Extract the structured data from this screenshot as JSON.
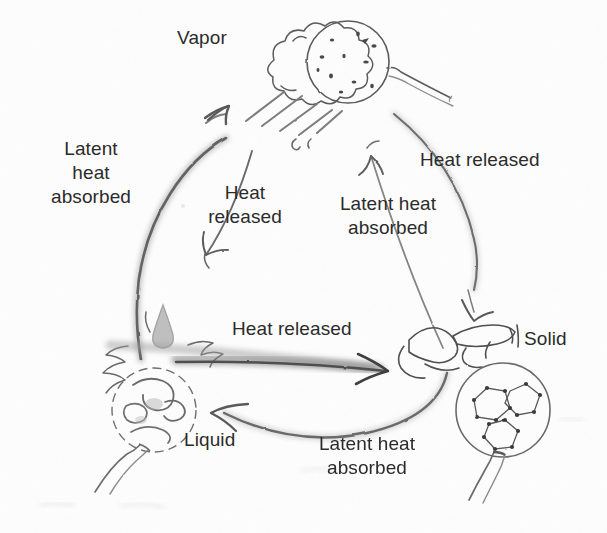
{
  "diagram": {
    "background_color": "#fefefe",
    "ink_color": "#5a5a5a",
    "text_color": "#2b2b2b",
    "states": {
      "vapor": "Vapor",
      "liquid": "Liquid",
      "solid": "Solid"
    },
    "labels": {
      "latent_heat_absorbed_left": "Latent\nheat\nabsorbed",
      "heat_released_top_left": "Heat\nreleased",
      "latent_heat_absorbed_middle": "Latent heat\nabsorbed",
      "heat_released_right": "Heat released",
      "heat_released_center": "Heat released",
      "latent_heat_absorbed_bottom": "Latent heat\nabsorbed"
    },
    "transitions": [
      {
        "from": "Liquid",
        "to": "Vapor",
        "label": "Latent heat absorbed",
        "arrow": "left-arc-up"
      },
      {
        "from": "Vapor",
        "to": "Liquid",
        "label": "Heat released",
        "arrow": "inner-left-down"
      },
      {
        "from": "Solid",
        "to": "Vapor",
        "label": "Latent heat absorbed",
        "arrow": "inner-right-up"
      },
      {
        "from": "Vapor",
        "to": "Solid",
        "label": "Heat released",
        "arrow": "right-arc-down"
      },
      {
        "from": "Liquid",
        "to": "Solid",
        "label": "Heat released",
        "arrow": "bottom-straight-right"
      },
      {
        "from": "Solid",
        "to": "Liquid",
        "label": "Latent heat absorbed",
        "arrow": "bottom-arc-left"
      }
    ]
  }
}
